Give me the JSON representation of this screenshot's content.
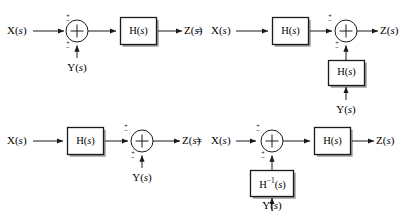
{
  "figure": {
    "type": "block-diagram",
    "background_color": "#ffffff",
    "line_color": "#1a1a1a",
    "box_fill": "#ffffff",
    "shadow_color": "#999999"
  },
  "labels": {
    "x": "X(",
    "y": "Y(",
    "z": "Z(",
    "s": "s",
    "paren_close": ")",
    "h": "H(",
    "h_inv_base": "H",
    "h_inv_exp": "−1",
    "equals": "=",
    "sum_symbol": "+",
    "sign_plus": "+",
    "sign_minus": "−"
  },
  "rows": [
    {
      "id": "row-1",
      "name": "summer-before-block-equivalence",
      "left": {
        "id": "row1-left",
        "input": "X(s)",
        "output": "Z(s)",
        "aux_input": "Y(s)",
        "elements": [
          "summing-junction",
          "H(s)"
        ],
        "order": "sum-then-H"
      },
      "relation": "=",
      "right": {
        "id": "row1-right",
        "input": "X(s)",
        "output": "Z(s)",
        "aux_input": "Y(s)",
        "aux_block": "H(s)",
        "elements": [
          "H(s)",
          "summing-junction"
        ],
        "order": "H-then-sum"
      }
    },
    {
      "id": "row-2",
      "name": "summer-after-block-equivalence",
      "left": {
        "id": "row2-left",
        "input": "X(s)",
        "output": "Z(s)",
        "aux_input": "Y(s)",
        "elements": [
          "H(s)",
          "summing-junction"
        ],
        "order": "H-then-sum"
      },
      "relation": "=",
      "right": {
        "id": "row2-right",
        "input": "X(s)",
        "output": "Z(s)",
        "aux_input": "Y(s)",
        "aux_block": "H−1(s)",
        "elements": [
          "summing-junction",
          "H(s)"
        ],
        "order": "sum-then-H"
      }
    }
  ],
  "text_items": {
    "r1l_x": "X(s)",
    "r1l_y": "Y(s)",
    "r1l_h": "H(s)",
    "r1l_z": "Z(s)",
    "r1_eq": "=",
    "r1r_x": "X(s)",
    "r1r_h": "H(s)",
    "r1r_hfb": "H(s)",
    "r1r_y": "Y(s)",
    "r1r_z": "Z(s)",
    "r2l_x": "X(s)",
    "r2l_h": "H(s)",
    "r2l_y": "Y(s)",
    "r2l_z": "Z(s)",
    "r2_eq": "=",
    "r2r_x": "X(s)",
    "r2r_h": "H(s)",
    "r2r_hfb": "H−1(s)",
    "r2r_y": "Y(s)",
    "r2r_z": "Z(s)"
  },
  "sign_marks": [
    {
      "id": "r1l-in-sign",
      "top": "+",
      "bottom": "−"
    },
    {
      "id": "r1l-aux-sign",
      "top": "+",
      "bottom": "−"
    },
    {
      "id": "r1r-in-sign",
      "top": "+",
      "bottom": "−"
    },
    {
      "id": "r1r-aux-sign",
      "top": "+",
      "bottom": "−"
    },
    {
      "id": "r2l-in-sign",
      "top": "+",
      "bottom": "−"
    },
    {
      "id": "r2l-aux-sign",
      "top": "+",
      "bottom": "−"
    },
    {
      "id": "r2r-in-sign",
      "top": "+",
      "bottom": "−"
    },
    {
      "id": "r2r-aux-sign",
      "top": "+",
      "bottom": "−"
    }
  ]
}
